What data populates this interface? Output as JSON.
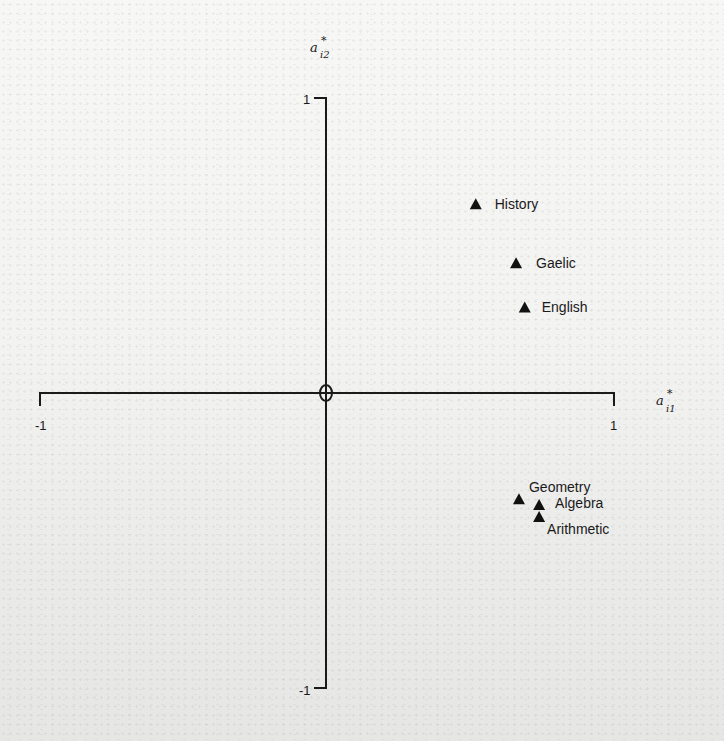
{
  "chart_data": {
    "type": "scatter",
    "title": "",
    "xlabel": "a*_i1",
    "ylabel": "a*_i2",
    "xlabel_parts": {
      "base": "a",
      "sup": "*",
      "sub": "i1"
    },
    "ylabel_parts": {
      "base": "a",
      "sup": "*",
      "sub": "i2"
    },
    "xlim": [
      -1,
      1
    ],
    "ylim": [
      -1,
      1
    ],
    "x_ticks": [
      "-1",
      "1"
    ],
    "y_ticks": [
      "-1",
      "1"
    ],
    "origin_label": "0",
    "grid": false,
    "legend": null,
    "marker": "triangle",
    "marker_color": "#111111",
    "axis_color": "#1a1a1a",
    "points": [
      {
        "label": "History",
        "x": 0.52,
        "y": 0.64
      },
      {
        "label": "Gaelic",
        "x": 0.66,
        "y": 0.44
      },
      {
        "label": "English",
        "x": 0.69,
        "y": 0.29
      },
      {
        "label": "Geometry",
        "x": 0.67,
        "y": -0.36
      },
      {
        "label": "Algebra",
        "x": 0.74,
        "y": -0.38
      },
      {
        "label": "Arithmetic",
        "x": 0.74,
        "y": -0.42
      }
    ]
  }
}
